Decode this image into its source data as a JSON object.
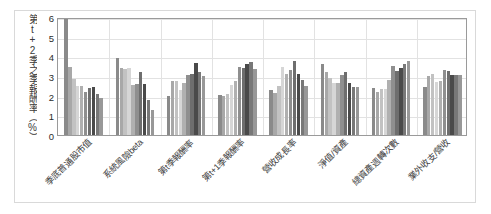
{
  "chart_data": {
    "type": "bar",
    "title": "",
    "xlabel": "",
    "ylabel": "第t+2季之季報酬率（%）",
    "ylim": [
      0,
      6
    ],
    "yticks": [
      0,
      1,
      2,
      3,
      4,
      5,
      6
    ],
    "grid": true,
    "legend": "none",
    "orientation": "vertical",
    "group_count": 8,
    "bars_per_group": 10,
    "categories": [
      "季底普通股市值",
      "系統風險beta",
      "第t季報酬率",
      "第t+1季報酬率",
      "營收成長率",
      "淨值/資產",
      "總資產週轉次數",
      "業外收支/營收"
    ],
    "series": [
      {
        "name": "分組1",
        "color": "#8a8a8a",
        "values": [
          6.1,
          3.92,
          1.97,
          2.02,
          2.27,
          3.6,
          2.39,
          2.43
        ]
      },
      {
        "name": "分組2",
        "color": "#a8a8a8",
        "values": [
          3.47,
          3.39,
          2.76,
          1.98,
          2.13,
          3.22,
          2.17,
          3.01
        ]
      },
      {
        "name": "分組3",
        "color": "#c2c2c2",
        "values": [
          2.86,
          3.34,
          2.76,
          2.1,
          2.47,
          2.9,
          2.36,
          3.1
        ]
      },
      {
        "name": "分組4",
        "color": "#d6d6d6",
        "values": [
          2.5,
          3.43,
          2.31,
          2.52,
          3.47,
          2.67,
          2.36,
          2.68
        ]
      },
      {
        "name": "分組5",
        "color": "#b0b0b0",
        "values": [
          2.47,
          2.55,
          2.66,
          2.77,
          3.08,
          2.67,
          2.78,
          2.74
        ]
      },
      {
        "name": "分組6",
        "color": "#8f8f8f",
        "values": [
          2.21,
          2.6,
          3.06,
          3.44,
          3.32,
          3.06,
          3.53,
          3.3
        ]
      },
      {
        "name": "分組7",
        "color": "#6e6e6e",
        "values": [
          2.41,
          3.2,
          3.1,
          3.43,
          3.77,
          3.22,
          3.26,
          3.24
        ]
      },
      {
        "name": "分組8",
        "color": "#4a4a4a",
        "values": [
          2.46,
          2.58,
          3.68,
          3.62,
          3.08,
          2.66,
          3.42,
          3.07
        ]
      },
      {
        "name": "分組9",
        "color": "#787878",
        "values": [
          2.08,
          1.8,
          3.18,
          3.72,
          2.8,
          2.46,
          3.6,
          3.06
        ]
      },
      {
        "name": "分組10",
        "color": "#989898",
        "values": [
          1.87,
          1.25,
          3.0,
          3.36,
          2.48,
          2.42,
          3.76,
          3.06
        ]
      }
    ]
  }
}
